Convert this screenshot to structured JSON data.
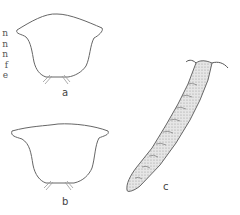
{
  "figure": {
    "cropped_text_line_endings": [
      "n",
      "n",
      "n",
      "f",
      "e"
    ],
    "panels": [
      {
        "id": "a",
        "label": "a",
        "description": "outline of rounded body with flared upper corners and bristles at base"
      },
      {
        "id": "b",
        "label": "b",
        "description": "outline of body with wide flared upper margin and bristles at base"
      },
      {
        "id": "c",
        "label": "c",
        "description": "stippled segmented elongate worm-like body, diagonal, with head appendages"
      }
    ],
    "colors": {
      "line": "#666666",
      "stipple": "#bdbdbd",
      "background": "#ffffff"
    }
  }
}
